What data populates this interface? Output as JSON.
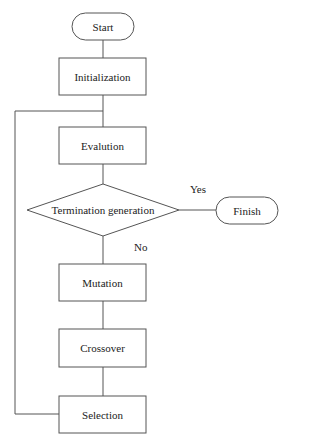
{
  "diagram": {
    "type": "flowchart",
    "colors": {
      "stroke": "#555555",
      "background": "#ffffff",
      "text": "#222222"
    },
    "nodes": {
      "start": {
        "label": "Start",
        "shape": "terminator"
      },
      "initialization": {
        "label": "Initialization",
        "shape": "process"
      },
      "evaluation": {
        "label": "Evalution",
        "shape": "process"
      },
      "termination": {
        "label": "Termination generation",
        "shape": "decision"
      },
      "finish": {
        "label": "Finish",
        "shape": "terminator"
      },
      "mutation": {
        "label": "Mutation",
        "shape": "process"
      },
      "crossover": {
        "label": "Crossover",
        "shape": "process"
      },
      "selection": {
        "label": "Selection",
        "shape": "process"
      }
    },
    "edge_labels": {
      "yes": "Yes",
      "no": "No"
    },
    "edges": [
      [
        "Start",
        "Initialization"
      ],
      [
        "Initialization",
        "Evalution"
      ],
      [
        "Evalution",
        "Termination generation"
      ],
      [
        "Termination generation",
        "Finish",
        "Yes"
      ],
      [
        "Termination generation",
        "Mutation",
        "No"
      ],
      [
        "Mutation",
        "Crossover"
      ],
      [
        "Crossover",
        "Selection"
      ],
      [
        "Selection",
        "Evalution",
        "loop"
      ]
    ]
  }
}
